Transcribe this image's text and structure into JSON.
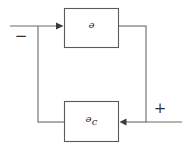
{
  "diagram": {
    "type": "control-system-block-diagram",
    "canvas": {
      "width": 182,
      "height": 149,
      "background": "#ffffff"
    },
    "stroke_color": "#6a6a6a",
    "box_stroke_color": "#5a5a5a",
    "text_color": "#2b2b2b",
    "blocks": [
      {
        "id": "plant",
        "label_main": "ᵊ",
        "label_text": "G",
        "label_sub": "",
        "x": 64,
        "y": 8,
        "width": 55,
        "height": 40
      },
      {
        "id": "controller",
        "label_main": "ᵊ",
        "label_text": "G",
        "label_sub": "c",
        "x": 64,
        "y": 101,
        "width": 55,
        "height": 41
      }
    ],
    "signs": {
      "minus": "−",
      "plus": "+"
    },
    "wires": [
      {
        "id": "input-to-plant",
        "from": "left-edge",
        "to": "plant-input",
        "y": 26
      },
      {
        "id": "plant-output",
        "from": "plant-output",
        "to": "right-bus",
        "y": 26
      },
      {
        "id": "right-bus-down",
        "from": "right-corner",
        "to": "feedback-line",
        "x": 146
      },
      {
        "id": "feedback-into-controller",
        "from": "right-bus",
        "to": "controller-input",
        "y": 122
      },
      {
        "id": "controller-output",
        "from": "controller-output",
        "to": "left-bus",
        "y": 122
      },
      {
        "id": "left-bus-up",
        "from": "summing-branch",
        "to": "input-line",
        "x": 38
      },
      {
        "id": "external-input",
        "from": "right-edge",
        "to": "right-bus",
        "y": 122
      }
    ]
  }
}
